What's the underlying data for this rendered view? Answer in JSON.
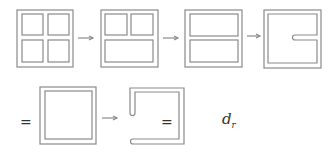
{
  "diagram": {
    "stroke_color": "#888888",
    "steps": [
      {
        "id": "step-1",
        "shape": "four-pane-frame"
      },
      {
        "id": "step-2",
        "shape": "two-top-one-bottom-frame"
      },
      {
        "id": "step-3",
        "shape": "two-horizontal-pane-frame"
      },
      {
        "id": "step-4",
        "shape": "single-pane-with-slot"
      },
      {
        "id": "step-5",
        "shape": "single-pane-frame"
      },
      {
        "id": "step-6",
        "shape": "open-c-shape-channel"
      }
    ],
    "labels": {
      "equals_1": "=",
      "equals_2": "=",
      "var_main": "d",
      "var_sub": "r"
    }
  }
}
